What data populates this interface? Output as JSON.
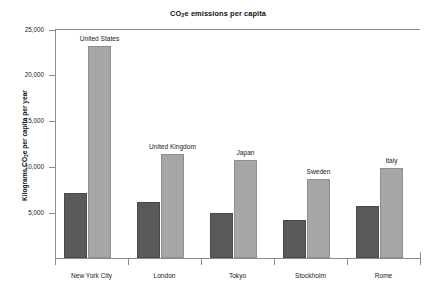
{
  "chart_data": {
    "type": "bar",
    "title": "CO2e emissions per capita",
    "title_parts": {
      "pre": "CO",
      "sub": "2",
      "post": "e emissions per capita"
    },
    "xlabel": "",
    "ylabel": "Kilograms CO2e per capita per year",
    "ylabel_parts": {
      "pre": "Kilograms CO",
      "sub": "2",
      "post": "e per capita per year"
    },
    "categories": [
      "New York City",
      "London",
      "Tokyo",
      "Stockholm",
      "Rome"
    ],
    "series": [
      {
        "name": "City",
        "color": "#595959",
        "values": [
          7200,
          6200,
          5000,
          4200,
          5700
        ],
        "point_labels": [
          "",
          "",
          "",
          "",
          ""
        ]
      },
      {
        "name": "Country",
        "color": "#a6a6a6",
        "values": [
          23200,
          11400,
          10800,
          8700,
          9900
        ],
        "point_labels": [
          "United States",
          "United Kingdom",
          "Japan",
          "Sweden",
          "Italy"
        ]
      }
    ],
    "ylim": [
      0,
      25000
    ],
    "yticks": [
      5000,
      10000,
      15000,
      20000,
      25000
    ],
    "ytick_labels": [
      "5,000",
      "10,000",
      "15,000",
      "20,000",
      "25,000"
    ],
    "grid": false,
    "legend": "none"
  }
}
